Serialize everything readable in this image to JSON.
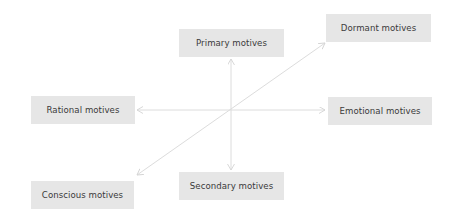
{
  "diagram": {
    "type": "motive-axes",
    "colors": {
      "box_fill": "#e6e6e6",
      "box_text": "#3a3a3a",
      "arrow": "#d9d9d9",
      "background": "#ffffff"
    },
    "nodes": [
      {
        "id": "primary",
        "label": "Primary motives"
      },
      {
        "id": "dormant",
        "label": "Dormant motives"
      },
      {
        "id": "rational",
        "label": "Rational motives"
      },
      {
        "id": "emotional",
        "label": "Emotional motives"
      },
      {
        "id": "conscious",
        "label": "Conscious motives"
      },
      {
        "id": "secondary",
        "label": "Secondary motives"
      }
    ],
    "edges": [
      {
        "from": "primary",
        "to": "secondary",
        "bidirectional": true,
        "axis": "vertical"
      },
      {
        "from": "rational",
        "to": "emotional",
        "bidirectional": true,
        "axis": "horizontal"
      },
      {
        "from": "conscious",
        "to": "dormant",
        "bidirectional": true,
        "axis": "diagonal"
      }
    ]
  }
}
